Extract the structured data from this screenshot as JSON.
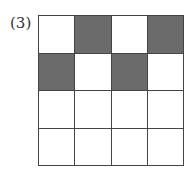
{
  "label": "(3)",
  "grid": {
    "rows": 4,
    "cols": 4,
    "filled_color": "#6b6b6b",
    "empty_color": "#ffffff",
    "cells": [
      [
        0,
        1,
        0,
        1
      ],
      [
        1,
        0,
        1,
        0
      ],
      [
        0,
        0,
        0,
        0
      ],
      [
        0,
        0,
        0,
        0
      ]
    ]
  }
}
